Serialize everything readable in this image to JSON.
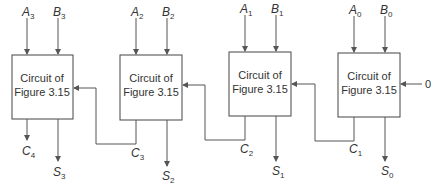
{
  "diagram": {
    "type": "4-bit ripple-carry adder",
    "stages": [
      {
        "id": "stage3",
        "line1": "Circuit of",
        "line2": "Figure 3.15",
        "inA": "A",
        "inA_sub": "3",
        "inB": "B",
        "inB_sub": "3",
        "carry_out": "C",
        "carry_out_sub": "4",
        "sum": "S",
        "sum_sub": "3"
      },
      {
        "id": "stage2",
        "line1": "Circuit of",
        "line2": "Figure 3.15",
        "inA": "A",
        "inA_sub": "2",
        "inB": "B",
        "inB_sub": "2",
        "carry_out": "C",
        "carry_out_sub": "3",
        "sum": "S",
        "sum_sub": "2"
      },
      {
        "id": "stage1",
        "line1": "Circuit of",
        "line2": "Figure 3.15",
        "inA": "A",
        "inA_sub": "1",
        "inB": "B",
        "inB_sub": "1",
        "carry_out": "C",
        "carry_out_sub": "2",
        "sum": "S",
        "sum_sub": "1"
      },
      {
        "id": "stage0",
        "line1": "Circuit of",
        "line2": "Figure 3.15",
        "inA": "A",
        "inA_sub": "0",
        "inB": "B",
        "inB_sub": "0",
        "carry_out": "C",
        "carry_out_sub": "1",
        "sum": "S",
        "sum_sub": "0"
      }
    ],
    "carry_in": "0",
    "colors": {
      "line": "#555555",
      "text": "#333333",
      "background": "#ffffff"
    }
  }
}
